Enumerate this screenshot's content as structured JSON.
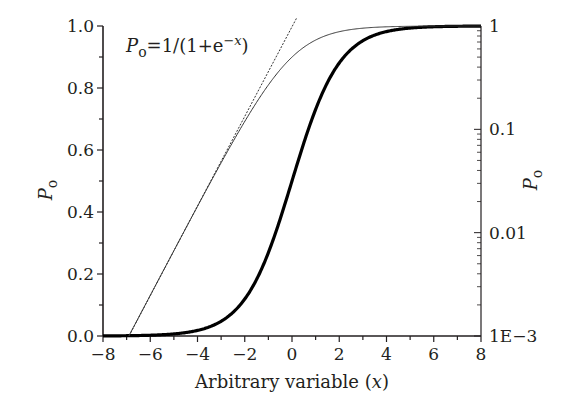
{
  "chart_data": {
    "type": "line",
    "title": "",
    "annotation": {
      "text_prefix": "P",
      "text_sub": "o",
      "text_main": "=1/(1+e",
      "text_sup": "−x",
      "text_end": ")"
    },
    "xlabel": "Arbitrary variable (x)",
    "xlabel_parts": {
      "main": "Arbitrary variable (",
      "var": "x",
      "end": ")"
    },
    "ylabel_left": {
      "main": "P",
      "sub": "o"
    },
    "ylabel_right": {
      "main": "P",
      "sub": "o"
    },
    "xlim": [
      -8,
      8
    ],
    "ylim_left": [
      0.0,
      1.0
    ],
    "ylim_right_log": [
      0.001,
      1
    ],
    "x_ticks": [
      -8,
      -6,
      -4,
      -2,
      0,
      2,
      4,
      6,
      8
    ],
    "x_tick_labels": [
      "−8",
      "−6",
      "−4",
      "−2",
      "0",
      "2",
      "4",
      "6",
      "8"
    ],
    "y_left_ticks": [
      0.0,
      0.2,
      0.4,
      0.6,
      0.8,
      1.0
    ],
    "y_left_tick_labels": [
      "0.0",
      "0.2",
      "0.4",
      "0.6",
      "0.8",
      "1.0"
    ],
    "y_right_ticks": [
      0.001,
      0.01,
      0.1,
      1
    ],
    "y_right_tick_labels": [
      "1E−3",
      "0.01",
      "0.1",
      "1"
    ],
    "grid": false,
    "legend": null,
    "series": [
      {
        "name": "Po (linear scale, left axis)",
        "style": "thick-solid",
        "axis": "left",
        "x": [
          -8,
          -7,
          -6,
          -5,
          -4,
          -3,
          -2,
          -1,
          0,
          1,
          2,
          3,
          4,
          5,
          6,
          7,
          8
        ],
        "values": [
          0.0003,
          0.0009,
          0.0025,
          0.0067,
          0.018,
          0.047,
          0.119,
          0.269,
          0.5,
          0.731,
          0.881,
          0.953,
          0.982,
          0.993,
          0.998,
          0.999,
          1.0
        ]
      },
      {
        "name": "Po (log scale, right axis)",
        "style": "thin-solid",
        "axis": "right",
        "x": [
          -7,
          -6,
          -5,
          -4,
          -3,
          -2,
          -1,
          0,
          1,
          2,
          3,
          4,
          5,
          6,
          7,
          8
        ],
        "values": [
          0.0009,
          0.0025,
          0.0067,
          0.018,
          0.047,
          0.119,
          0.269,
          0.5,
          0.731,
          0.881,
          0.953,
          0.982,
          0.993,
          0.998,
          0.999,
          1.0
        ]
      },
      {
        "name": "Asymptote Po ≈ e^x (log scale, right axis)",
        "style": "dotted",
        "axis": "right",
        "x": [
          -6.9,
          0.2
        ],
        "values": [
          0.001,
          1.2
        ]
      }
    ]
  }
}
